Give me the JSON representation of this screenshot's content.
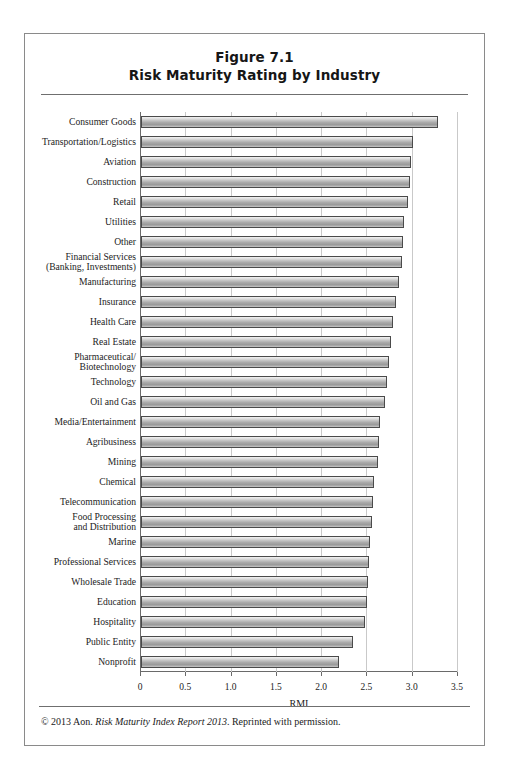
{
  "figure": {
    "title_line1": "Figure 7.1",
    "title_line2": "Risk Maturity Rating by Industry",
    "footer_prefix": "© 2013 Aon. ",
    "footer_italic": "Risk Maturity Index Report 2013",
    "footer_suffix": ". Reprinted with permission."
  },
  "chart_data": {
    "type": "bar",
    "orientation": "horizontal",
    "xlabel": "RMI",
    "ylabel": "",
    "xlim": [
      0,
      3.5
    ],
    "xticks": [
      0,
      0.5,
      1.0,
      1.5,
      2.0,
      2.5,
      3.0,
      3.5
    ],
    "xticklabels": [
      "0",
      "0.5",
      "1.0",
      "1.5",
      "2.0",
      "2.5",
      "3.0",
      "3.5"
    ],
    "grid": "vertical",
    "legend": "none",
    "categories": [
      "Consumer Goods",
      "Transportation/Logistics",
      "Aviation",
      "Construction",
      "Retail",
      "Utilities",
      "Other",
      "Financial Services\n(Banking, Investments)",
      "Manufacturing",
      "Insurance",
      "Health Care",
      "Real Estate",
      "Pharmaceutical/\nBiotechnology",
      "Technology",
      "Oil and Gas",
      "Media/Entertainment",
      "Agribusiness",
      "Mining",
      "Chemical",
      "Telecommunication",
      "Food Processing\nand Distribution",
      "Marine",
      "Professional Services",
      "Wholesale Trade",
      "Education",
      "Hospitality",
      "Public Entity",
      "Nonprofit"
    ],
    "values": [
      3.28,
      3.0,
      2.98,
      2.97,
      2.95,
      2.9,
      2.89,
      2.88,
      2.85,
      2.82,
      2.78,
      2.76,
      2.74,
      2.72,
      2.69,
      2.64,
      2.63,
      2.62,
      2.57,
      2.56,
      2.55,
      2.53,
      2.52,
      2.51,
      2.49,
      2.47,
      2.34,
      2.19
    ]
  }
}
